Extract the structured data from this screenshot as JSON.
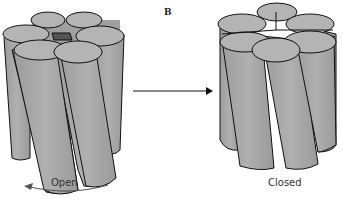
{
  "panel_label": "B",
  "left": {
    "label": "Open",
    "state": "open"
  },
  "right": {
    "label": "Closed",
    "state": "closed"
  },
  "colors": {
    "fill": "#a8a8a8",
    "top": "#b5b5b5",
    "pore": "#555555",
    "stroke": "#111111"
  }
}
